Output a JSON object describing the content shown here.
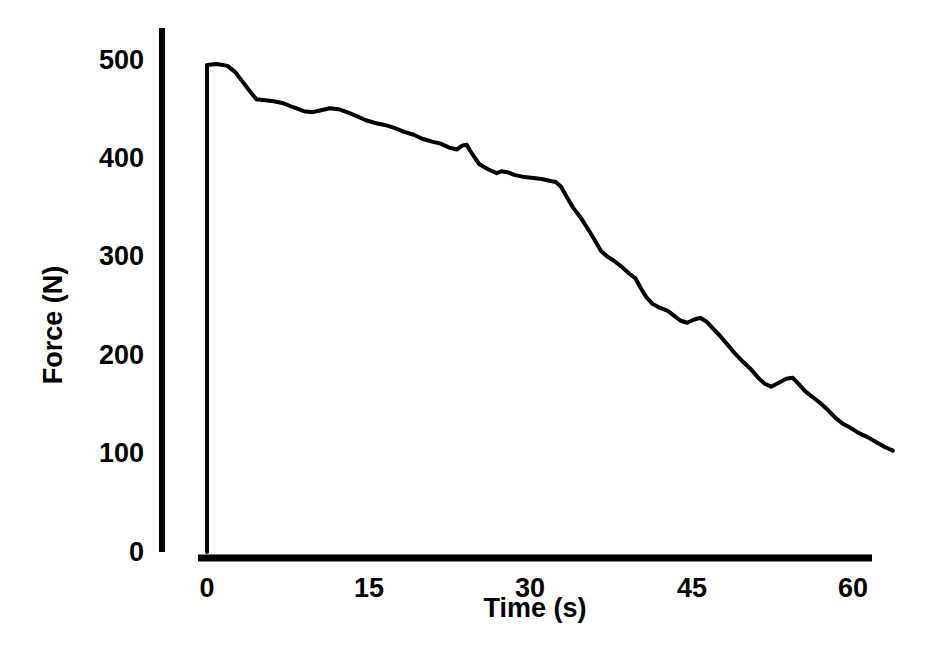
{
  "chart_data": {
    "type": "line",
    "title": "",
    "xlabel": "Time (s)",
    "ylabel": "Force (N)",
    "xlim": [
      0,
      64
    ],
    "ylim": [
      0,
      520
    ],
    "xticks": [
      0,
      15,
      30,
      45,
      60
    ],
    "xtick_labels": [
      "0",
      "15",
      "30",
      "45",
      "60"
    ],
    "yticks": [
      0,
      100,
      200,
      300,
      400,
      500
    ],
    "ytick_labels": [
      "0",
      "100",
      "200",
      "300",
      "400",
      "500"
    ],
    "grid": false,
    "legend": "none",
    "line_color": "#000000",
    "line_width": 4,
    "axis_color": "#000000",
    "background": "#ffffff",
    "series": [
      {
        "name": "Force decay",
        "x": [
          0.0,
          0.0,
          0.9,
          1.9,
          2.6,
          3.3,
          4.0,
          4.6,
          5.4,
          6.2,
          7.1,
          8.0,
          9.0,
          9.8,
          10.6,
          11.4,
          12.2,
          13.0,
          13.9,
          14.7,
          15.6,
          16.5,
          17.4,
          18.3,
          19.2,
          20.0,
          20.9,
          21.7,
          22.5,
          23.2,
          23.7,
          24.1,
          24.6,
          25.3,
          26.1,
          26.9,
          27.4,
          27.9,
          28.6,
          29.5,
          30.3,
          31.1,
          31.9,
          32.4,
          32.9,
          33.4,
          34.0,
          34.7,
          35.4,
          36.0,
          36.6,
          37.2,
          37.8,
          38.5,
          39.2,
          39.8,
          40.3,
          40.8,
          41.4,
          42.1,
          42.8,
          43.4,
          44.0,
          44.6,
          45.2,
          45.8,
          46.4,
          47.0,
          47.7,
          48.4,
          49.1,
          49.8,
          50.5,
          51.2,
          51.8,
          52.4,
          53.1,
          53.8,
          54.4,
          55.0,
          55.6,
          56.3,
          57.0,
          57.7,
          58.4,
          59.1,
          59.8,
          60.5,
          61.3,
          62.1,
          62.9,
          63.7
        ],
        "y": [
          0,
          495,
          496,
          494,
          488,
          478,
          468,
          460,
          459,
          458,
          456,
          452,
          448,
          447,
          449,
          451,
          450,
          447,
          443,
          439,
          436,
          434,
          431,
          427,
          424,
          420,
          417,
          415,
          411,
          409,
          413,
          414,
          405,
          394,
          389,
          385,
          387,
          386,
          383,
          381,
          380,
          379,
          377,
          376,
          371,
          361,
          350,
          340,
          328,
          317,
          306,
          300,
          296,
          290,
          283,
          278,
          268,
          259,
          252,
          248,
          245,
          240,
          235,
          233,
          236,
          238,
          234,
          227,
          219,
          210,
          201,
          193,
          186,
          177,
          171,
          168,
          172,
          176,
          177,
          170,
          163,
          157,
          151,
          144,
          136,
          130,
          126,
          121,
          117,
          112,
          107,
          103
        ]
      }
    ]
  },
  "axes": {
    "y_axis_label": "Force (N)",
    "x_axis_label": "Time (s)"
  }
}
